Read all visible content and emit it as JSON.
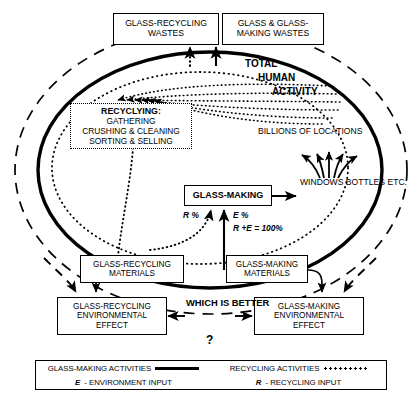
{
  "diagram": {
    "zones": {
      "total_human_activity": {
        "line1": "TOTAL",
        "line2": "HUMAN",
        "line3": "ACTIVITY"
      },
      "billions_of_locations": "BILLIONS OF LOCATIONS"
    },
    "boxes": {
      "recycling_wastes": {
        "line1": "GLASS-RECYCLING",
        "line2": "WASTES"
      },
      "glassmaking_wastes": {
        "line1": "GLASS & GLASS-",
        "line2": "MAKING WASTES"
      },
      "recycling_process": {
        "line1": "RECYCLYING:",
        "line2": "GATHERING",
        "line3": "CRUSHING & CLEANING",
        "line4": "SORTING & SELLING"
      },
      "glass_making": {
        "line1": "GLASS-MAKING"
      },
      "products": {
        "line1": "WINDOWS",
        "line2": "BOTTLES",
        "line3": "ETC."
      },
      "recycling_materials": {
        "line1": "GLASS-RECYCLING",
        "line2": "MATERIALS"
      },
      "glassmaking_materials": {
        "line1": "GLASS-MAKING",
        "line2": "MATERIALS"
      },
      "recycling_env_effect": {
        "line1": "GLASS-RECYCLING",
        "line2": "ENVIRONMENTAL",
        "line3": "EFFECT"
      },
      "glassmaking_env_effect": {
        "line1": "GLASS-MAKING",
        "line2": "ENVIRONMENTAL",
        "line3": "EFFECT"
      }
    },
    "annotations": {
      "r_percent": "R %",
      "e_percent": "E %",
      "sum_equation": "R +E  = 100%",
      "which_is_better": {
        "line1": "WHICH",
        "line2": "IS",
        "line3": "BETTER",
        "line4": "?"
      }
    },
    "legend": {
      "glassmaking_activities": "GLASS-MAKING ACTIVITIES",
      "recycling_activities": "RECYCLING ACTIVITIES",
      "environment_input_symbol": "E",
      "environment_input_text": "- ENVIRONMENT INPUT",
      "recycling_input_symbol": "R",
      "recycling_input_text": "- RECYCLING INPUT"
    },
    "colors": {
      "ink": "#000000",
      "paper": "#ffffff"
    }
  }
}
